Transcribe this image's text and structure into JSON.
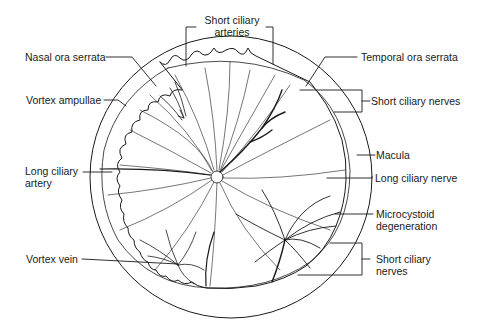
{
  "figure": {
    "colors": {
      "ink": "#1a1a1a",
      "background": "#ffffff"
    }
  },
  "labels": {
    "short_ciliary_arteries": {
      "line1": "Short ciliary",
      "line2": "arteries"
    },
    "nasal_ora_serrata": "Nasal ora serrata",
    "temporal_ora_serrata": "Temporal ora serrata",
    "vortex_ampullae": "Vortex ampullae",
    "short_ciliary_nerves_top": "Short ciliary nerves",
    "macula": "Macula",
    "long_ciliary_artery": {
      "line1": "Long ciliary",
      "line2": "artery"
    },
    "long_ciliary_nerve": "Long ciliary nerve",
    "microcystoid_degeneration": {
      "line1": "Microcystoid",
      "line2": "degeneration"
    },
    "vortex_vein": "Vortex vein",
    "short_ciliary_nerves_bottom": {
      "line1": "Short ciliary",
      "line2": "nerves"
    }
  }
}
